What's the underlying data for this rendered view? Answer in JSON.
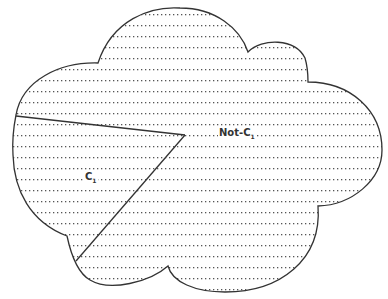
{
  "diagram": {
    "regions": [
      {
        "id": "c1",
        "label": "C",
        "subscript": "1"
      },
      {
        "id": "not-c1",
        "label": "Not-C",
        "subscript": "1"
      }
    ],
    "colors": {
      "outline": "#333333",
      "hatch": "#555555",
      "background": "#ffffff"
    }
  }
}
